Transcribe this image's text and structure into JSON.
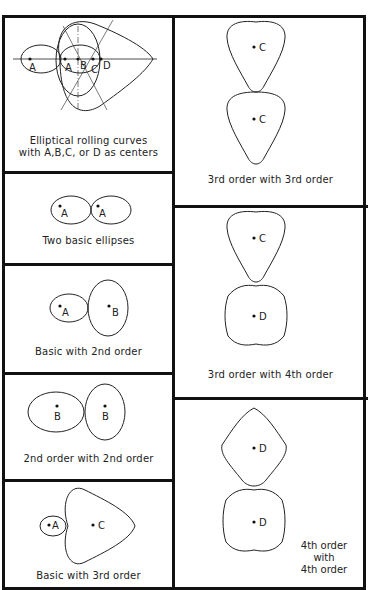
{
  "figure": {
    "panels": [
      {
        "id": "rolling-curves",
        "caption_line1": "Elliptical rolling curves",
        "caption_line2": "with A,B,C, or D as centers",
        "labels": [
          "A",
          "A",
          "B",
          "C",
          "D"
        ]
      },
      {
        "id": "two-basic",
        "caption": "Two basic ellipses",
        "labels": [
          "A",
          "A"
        ]
      },
      {
        "id": "basic-2nd",
        "caption": "Basic with 2nd order",
        "labels": [
          "A",
          "B"
        ]
      },
      {
        "id": "2nd-2nd",
        "caption": "2nd order with 2nd order",
        "labels": [
          "B",
          "B"
        ]
      },
      {
        "id": "basic-3rd",
        "caption": "Basic with 3rd order",
        "labels": [
          "A",
          "C"
        ]
      },
      {
        "id": "3rd-3rd",
        "caption": "3rd order with 3rd order",
        "labels": [
          "C",
          "C"
        ]
      },
      {
        "id": "3rd-4th",
        "caption": "3rd order with 4th order",
        "labels": [
          "C",
          "D"
        ]
      },
      {
        "id": "4th-4th",
        "caption_line1": "4th order",
        "caption_line2": "with",
        "caption_line3": "4th order",
        "labels": [
          "D",
          "D"
        ]
      }
    ]
  }
}
